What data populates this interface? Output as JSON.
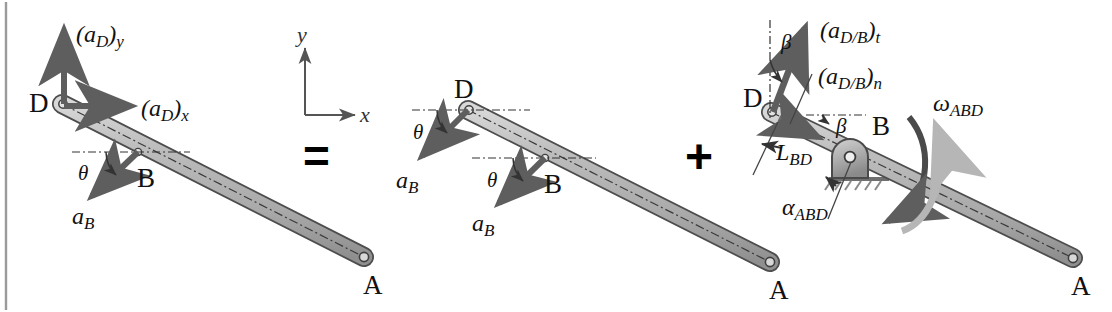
{
  "figure": {
    "type": "kinematics-vector-diagram",
    "operators": {
      "equals": "=",
      "plus": "+"
    },
    "colors": {
      "rod_fill": "#b3b3b3",
      "rod_stroke": "#4d4d4d",
      "arrow_dark": "#595959",
      "arrow_light": "#b5b5b5",
      "text": "#111111",
      "border_line": "#9a9a9a",
      "ground_hatch": "#7a7a7a"
    }
  },
  "axes": {
    "x_label": "x",
    "y_label": "y"
  },
  "panels": [
    {
      "id": "panel-left",
      "name": "total-acceleration-panel",
      "points": [
        {
          "label": "D",
          "name": "point-d"
        },
        {
          "label": "B",
          "name": "point-b"
        },
        {
          "label": "A",
          "name": "point-a"
        }
      ],
      "vectors": [
        {
          "label": "(a_D)_y",
          "base": "(a",
          "sub": "D",
          "post": ")",
          "post_sub": "y",
          "name": "vector-aD-y",
          "dir": "up"
        },
        {
          "label": "(a_D)_x",
          "base": "(a",
          "sub": "D",
          "post": ")",
          "post_sub": "x",
          "name": "vector-aD-x",
          "dir": "right"
        },
        {
          "label": "a_B",
          "base": "a",
          "sub": "B",
          "name": "vector-aB",
          "dir": "down-left"
        }
      ],
      "angles": [
        {
          "label": "θ",
          "name": "angle-theta-b"
        }
      ]
    },
    {
      "id": "panel-middle",
      "name": "translation-panel",
      "points": [
        {
          "label": "D",
          "name": "point-d"
        },
        {
          "label": "B",
          "name": "point-b"
        },
        {
          "label": "A",
          "name": "point-a"
        }
      ],
      "vectors": [
        {
          "label": "a_B",
          "base": "a",
          "sub": "B",
          "name": "vector-aB-at-d",
          "dir": "down-left"
        },
        {
          "label": "a_B",
          "base": "a",
          "sub": "B",
          "name": "vector-aB-at-b",
          "dir": "down-left"
        }
      ],
      "angles": [
        {
          "label": "θ",
          "name": "angle-theta-d"
        },
        {
          "label": "θ",
          "name": "angle-theta-b"
        }
      ]
    },
    {
      "id": "panel-right",
      "name": "rotation-panel",
      "points": [
        {
          "label": "D",
          "name": "point-d"
        },
        {
          "label": "B",
          "name": "point-b"
        },
        {
          "label": "A",
          "name": "point-a"
        }
      ],
      "vectors": [
        {
          "label": "(a_D/B)_t",
          "base": "(a",
          "sub": "D/B",
          "post": ")",
          "post_sub": "t",
          "name": "vector-aDB-tangential"
        },
        {
          "label": "(a_D/B)_n",
          "base": "(a",
          "sub": "D/B",
          "post": ")",
          "post_sub": "n",
          "name": "vector-aDB-normal"
        }
      ],
      "angles": [
        {
          "label": "β",
          "name": "angle-beta-top"
        },
        {
          "label": "β",
          "name": "angle-beta-rod"
        }
      ],
      "dimensions": [
        {
          "label": "L_BD",
          "base": "L",
          "sub": "BD",
          "name": "dimension-L-BD"
        }
      ],
      "motion": [
        {
          "label": "ω_ABD",
          "base": "ω",
          "sub": "ABD",
          "name": "angular-velocity-omega-ABD"
        },
        {
          "label": "α_ABD",
          "base": "α",
          "sub": "ABD",
          "name": "angular-acceleration-alpha-ABD"
        }
      ],
      "support": {
        "name": "pin-support-at-b",
        "label": ""
      }
    }
  ]
}
